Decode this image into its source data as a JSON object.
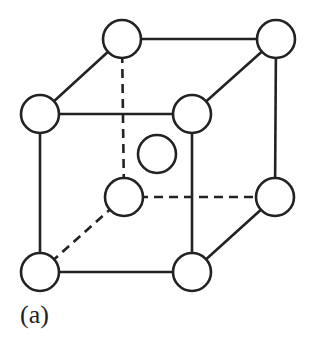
{
  "diagram": {
    "label": "(a)",
    "colors": {
      "stroke": "#222222",
      "fill": "#ffffff",
      "background": "#ffffff"
    },
    "atoms": [
      {
        "id": "back-top-left",
        "x": 122,
        "y": 39
      },
      {
        "id": "back-top-right",
        "x": 276,
        "y": 39
      },
      {
        "id": "front-top-left",
        "x": 40,
        "y": 114
      },
      {
        "id": "front-top-right",
        "x": 192,
        "y": 114
      },
      {
        "id": "body-center",
        "x": 157,
        "y": 154
      },
      {
        "id": "back-bottom-left",
        "x": 124,
        "y": 197
      },
      {
        "id": "back-bottom-right",
        "x": 275,
        "y": 197
      },
      {
        "id": "front-bottom-left",
        "x": 40,
        "y": 272
      },
      {
        "id": "front-bottom-right",
        "x": 192,
        "y": 272
      }
    ],
    "atom_radius": 19
  }
}
